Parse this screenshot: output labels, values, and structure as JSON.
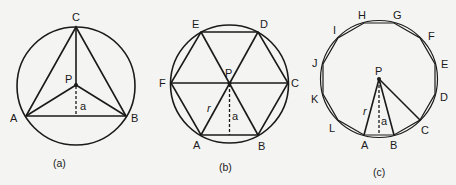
{
  "figure": {
    "panels": [
      {
        "id": "a",
        "caption": "(a)",
        "shape": "equilateral triangle inscribed in circle",
        "center_label": "P",
        "apothem_label": "a",
        "vertex_labels": [
          "A",
          "B",
          "C"
        ]
      },
      {
        "id": "b",
        "caption": "(b)",
        "shape": "regular hexagon inscribed in circle",
        "center_label": "P",
        "apothem_label": "a",
        "radius_label": "r",
        "vertex_labels": [
          "A",
          "B",
          "C",
          "D",
          "E",
          "F"
        ]
      },
      {
        "id": "c",
        "caption": "(c)",
        "shape": "regular dodecagon inscribed in circle",
        "center_label": "P",
        "apothem_label": "a",
        "radius_label": "r",
        "vertex_labels": [
          "A",
          "B",
          "C",
          "D",
          "E",
          "F",
          "G",
          "H",
          "I",
          "J",
          "K",
          "L"
        ]
      }
    ]
  },
  "labels": {
    "a": {
      "A": "A",
      "B": "B",
      "C": "C",
      "P": "P",
      "apothem": "a",
      "caption": "(a)"
    },
    "b": {
      "A": "A",
      "B": "B",
      "C": "C",
      "D": "D",
      "E": "E",
      "F": "F",
      "P": "P",
      "apothem": "a",
      "radius": "r",
      "caption": "(b)"
    },
    "c": {
      "A": "A",
      "B": "B",
      "C": "C",
      "D": "D",
      "E": "E",
      "F": "F",
      "G": "G",
      "H": "H",
      "I": "I",
      "J": "J",
      "K": "K",
      "L": "L",
      "P": "P",
      "apothem": "a",
      "radius": "r",
      "caption": "(c)"
    }
  },
  "colors": {
    "ink": "#1a1a1a",
    "paper": "#f4f4f2"
  }
}
